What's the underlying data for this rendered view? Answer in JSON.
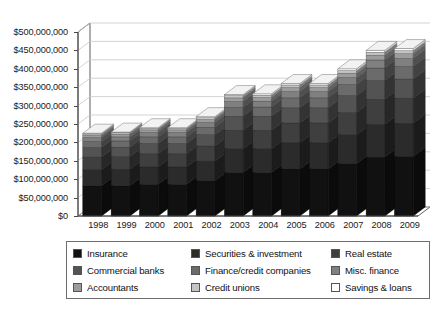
{
  "chart_data": {
    "type": "bar",
    "subtype": "stacked-bar-3d",
    "title": "",
    "subtitle": "",
    "xlabel": "",
    "ylabel": "",
    "categories": [
      "1998",
      "1999",
      "2000",
      "2001",
      "2002",
      "2003",
      "2004",
      "2005",
      "2006",
      "2007",
      "2008",
      "2009"
    ],
    "ylim": [
      0,
      500000000
    ],
    "ytick_values": [
      0,
      50000000,
      100000000,
      150000000,
      200000000,
      250000000,
      300000000,
      350000000,
      400000000,
      450000000,
      500000000
    ],
    "ytick_labels": [
      "$0",
      "$50,000,000",
      "$100,000,000",
      "$150,000,000",
      "$200,000,000",
      "$250,000,000",
      "$300,000,000",
      "$350,000,000",
      "$400,000,000",
      "$450,000,000",
      "$500,000,000"
    ],
    "grid": true,
    "grid_axis": "y",
    "legend_position": "bottom",
    "totals": [
      225000000,
      228000000,
      240000000,
      240000000,
      270000000,
      330000000,
      332000000,
      360000000,
      360000000,
      400000000,
      450000000,
      455000000
    ],
    "series": [
      {
        "name": "Insurance",
        "color": "#111111",
        "values": [
          82000000,
          82000000,
          86000000,
          86000000,
          96000000,
          118000000,
          118000000,
          128000000,
          128000000,
          142000000,
          160000000,
          162000000
        ]
      },
      {
        "name": "Securities & investment",
        "color": "#2b2b2b",
        "values": [
          44000000,
          45000000,
          47000000,
          47000000,
          53000000,
          65000000,
          65000000,
          71000000,
          71000000,
          79000000,
          89000000,
          90000000
        ]
      },
      {
        "name": "Real estate",
        "color": "#3f3f3f",
        "values": [
          34000000,
          34000000,
          36000000,
          36000000,
          41000000,
          50000000,
          50000000,
          54000000,
          54000000,
          60000000,
          68000000,
          68000000
        ]
      },
      {
        "name": "Commercial banks",
        "color": "#535353",
        "values": [
          26000000,
          26000000,
          28000000,
          28000000,
          31000000,
          38000000,
          38000000,
          41000000,
          41000000,
          46000000,
          51000000,
          52000000
        ]
      },
      {
        "name": "Finance/credit companies",
        "color": "#6b6b6b",
        "values": [
          16000000,
          17000000,
          18000000,
          18000000,
          20000000,
          24000000,
          25000000,
          27000000,
          27000000,
          30000000,
          34000000,
          34000000
        ]
      },
      {
        "name": "Misc. finance",
        "color": "#808080",
        "values": [
          11000000,
          11000000,
          12000000,
          12000000,
          13000000,
          16000000,
          16000000,
          17000000,
          17000000,
          19000000,
          22000000,
          22000000
        ]
      },
      {
        "name": "Accountants",
        "color": "#9c9c9c",
        "values": [
          6000000,
          7000000,
          7000000,
          7000000,
          8000000,
          10000000,
          10000000,
          11000000,
          11000000,
          12000000,
          13000000,
          13000000
        ]
      },
      {
        "name": "Credit unions",
        "color": "#c4c4c4",
        "values": [
          4000000,
          4000000,
          4000000,
          4000000,
          5000000,
          6000000,
          6000000,
          7000000,
          7000000,
          7000000,
          8000000,
          8000000
        ]
      },
      {
        "name": "Savings & loans",
        "color": "#ffffff",
        "values": [
          2000000,
          2000000,
          2000000,
          2000000,
          3000000,
          3000000,
          4000000,
          4000000,
          4000000,
          5000000,
          5000000,
          6000000
        ]
      }
    ]
  },
  "legend": {
    "items": [
      {
        "label": "Insurance",
        "color": "#111111"
      },
      {
        "label": "Securities & investment",
        "color": "#2b2b2b"
      },
      {
        "label": "Real estate",
        "color": "#3f3f3f"
      },
      {
        "label": "Commercial banks",
        "color": "#535353"
      },
      {
        "label": "Finance/credit companies",
        "color": "#6b6b6b"
      },
      {
        "label": "Misc. finance",
        "color": "#808080"
      },
      {
        "label": "Accountants",
        "color": "#9c9c9c"
      },
      {
        "label": "Credit unions",
        "color": "#c4c4c4"
      },
      {
        "label": "Savings & loans",
        "color": "#ffffff"
      }
    ]
  },
  "style": {
    "background": "#ffffff",
    "axis_color": "#4a4a4a",
    "grid_color": "#c8c8c8",
    "text_color": "#111111",
    "legend_border": "#6e6e6e"
  }
}
